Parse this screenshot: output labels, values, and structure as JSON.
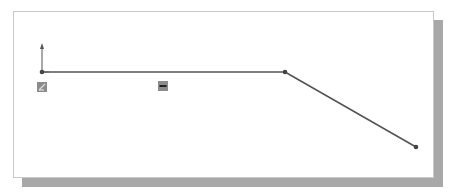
{
  "sketch": {
    "colors": {
      "line": "#555555",
      "point": "#444444",
      "frame_border": "#c8c8c8",
      "shadow": "#a8a8a8",
      "relation_icon_bg": "#8c8c8c"
    },
    "origin": {
      "x": 42,
      "y": 72
    },
    "segments": [
      {
        "name": "horizontal-line",
        "x1": 42,
        "y1": 72,
        "x2": 285,
        "y2": 72
      },
      {
        "name": "sloped-line",
        "x1": 285,
        "y1": 72,
        "x2": 416,
        "y2": 147
      }
    ],
    "points": [
      {
        "x": 42,
        "y": 72
      },
      {
        "x": 285,
        "y": 72
      },
      {
        "x": 416,
        "y": 147
      }
    ],
    "relations": [
      {
        "type": "coincident",
        "x": 37,
        "y": 82
      },
      {
        "type": "horizontal",
        "x": 158,
        "y": 81
      }
    ]
  }
}
